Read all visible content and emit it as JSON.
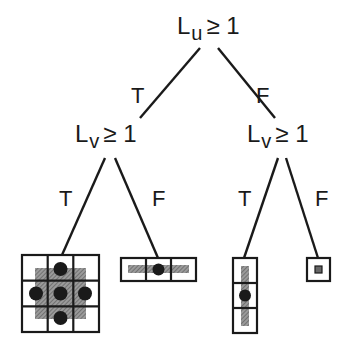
{
  "tree": {
    "root": {
      "var": "L",
      "sub": "u",
      "op": "≥ 1"
    },
    "left": {
      "var": "L",
      "sub": "v",
      "op": "≥ 1"
    },
    "right": {
      "var": "L",
      "sub": "v",
      "op": "≥ 1"
    },
    "edge_labels": {
      "root_left": "T",
      "root_right": "F",
      "left_left": "T",
      "left_right": "F",
      "right_left": "T",
      "right_right": "F"
    },
    "leaves": [
      {
        "name": "3x3 grid, cross-shaped shaded kernel with 5 dots",
        "cols": 3,
        "rows": 3
      },
      {
        "name": "1x3 horizontal kernel with center dot",
        "cols": 3,
        "rows": 1
      },
      {
        "name": "3x1 vertical kernel with center dot",
        "cols": 1,
        "rows": 3
      },
      {
        "name": "single cell kernel",
        "cols": 1,
        "rows": 1
      }
    ]
  },
  "colors": {
    "ink": "#1a1a1a",
    "shade": "#8c8c8c",
    "background": "#ffffff"
  }
}
